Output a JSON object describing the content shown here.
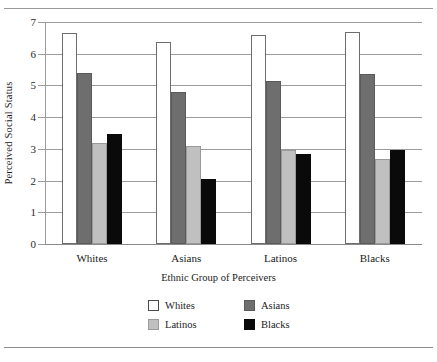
{
  "figure": {
    "top_rule": "horizontal-rule",
    "bottom_rule": "horizontal-rule",
    "cut_title": ""
  },
  "chart_data": {
    "type": "bar",
    "title": "",
    "xlabel": "Ethnic Group of Perceivers",
    "ylabel": "Perceived Social Status",
    "categories": [
      "Whites",
      "Asians",
      "Latinos",
      "Blacks"
    ],
    "ylim": [
      0,
      7
    ],
    "yticks": [
      0,
      1,
      2,
      3,
      4,
      5,
      6,
      7
    ],
    "ytick_labels": [
      "0",
      "1",
      "2",
      "3",
      "4",
      "5",
      "6",
      "7"
    ],
    "grid": true,
    "legend_position": "bottom-center",
    "series": [
      {
        "name": "Whites",
        "color": "#ffffff",
        "values": [
          6.65,
          6.38,
          6.58,
          6.7
        ]
      },
      {
        "name": "Asians",
        "color": "#6e6e6e",
        "values": [
          5.4,
          4.8,
          5.15,
          5.35
        ]
      },
      {
        "name": "Latinos",
        "color": "#c0c0c0",
        "values": [
          3.18,
          3.1,
          2.96,
          2.67
        ]
      },
      {
        "name": "Blacks",
        "color": "#0a0a0a",
        "values": [
          3.47,
          2.05,
          2.84,
          2.97
        ]
      }
    ]
  }
}
